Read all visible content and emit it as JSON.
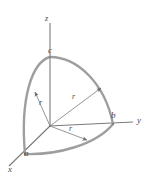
{
  "figure": {
    "type": "geometry-diagram",
    "colors": {
      "axis": "#777777",
      "arc": "#9a9a9a",
      "radius_line": "#8a8a8a",
      "label": "#4a4a4a",
      "background": "#ffffff"
    },
    "axes": [
      {
        "id": "x",
        "label": "x",
        "label_x": 9,
        "label_y": 167
      },
      {
        "id": "y",
        "label": "y",
        "label_x": 137,
        "label_y": 119
      },
      {
        "id": "z",
        "label": "z",
        "label_x": 45,
        "label_y": 17
      }
    ],
    "points": [
      {
        "id": "a",
        "label": "a",
        "label_x": 24,
        "label_y": 150,
        "axis": "x"
      },
      {
        "id": "b",
        "label": "b",
        "label_x": 111,
        "label_y": 113,
        "axis": "y"
      },
      {
        "id": "c",
        "label": "c",
        "label_x": 48,
        "label_y": 48,
        "axis": "z"
      }
    ],
    "radius_labels": [
      {
        "id": "r-left",
        "label": "r",
        "label_x": 39,
        "label_y": 100
      },
      {
        "id": "r-upper",
        "label": "r",
        "label_x": 72,
        "label_y": 94
      },
      {
        "id": "r-lower",
        "label": "r",
        "label_x": 69,
        "label_y": 126
      }
    ]
  }
}
